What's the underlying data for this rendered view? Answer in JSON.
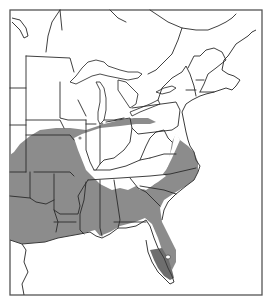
{
  "map": {
    "title": "",
    "region": "Eastern United States and southeastern Canada",
    "legend": [],
    "colors": {
      "background": "#ffffff",
      "frame": "#555555",
      "borders": "#2a2a2a",
      "range_primary": "#8c8c8c",
      "range_secondary": "#6e6e6e"
    },
    "layers": [
      {
        "name": "species-range",
        "fill": "#8c8c8c"
      },
      {
        "name": "southern-florida-range",
        "fill": "#6e6e6e"
      },
      {
        "name": "isolated-occurrence-dots",
        "count": 2
      }
    ]
  }
}
